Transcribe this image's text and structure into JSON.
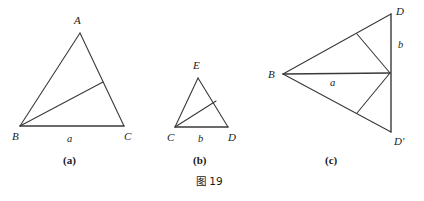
{
  "figure": {
    "caption": "图 19",
    "caption_x": 196,
    "caption_y": 176,
    "stroke_color": "#3a3a3a",
    "background_color": "#ffffff"
  },
  "panels": [
    {
      "id": "panel-a",
      "sublabel": "(a)",
      "sublabel_x": 63,
      "sublabel_y": 155,
      "description": "Triangle ABC with a cevian drawn from vertex B to a point on side AC",
      "vertices": [
        {
          "name": "A",
          "x": 80,
          "y": 33,
          "label_x": 74,
          "label_y": 15
        },
        {
          "name": "B",
          "x": 20,
          "y": 126,
          "label_x": 12,
          "label_y": 131
        },
        {
          "name": "C",
          "x": 124,
          "y": 126,
          "label_x": 124,
          "label_y": 131
        }
      ],
      "cevian_point": {
        "x": 103,
        "y": 82
      },
      "edge_labels": [
        {
          "text": "a",
          "x": 67,
          "y": 134,
          "side": "BC"
        }
      ]
    },
    {
      "id": "panel-b",
      "sublabel": "(b)",
      "sublabel_x": 193,
      "sublabel_y": 155,
      "description": "Triangle ECD with a cevian drawn from vertex C to a point on side ED",
      "vertices": [
        {
          "name": "E",
          "x": 198,
          "y": 78,
          "label_x": 193,
          "label_y": 60
        },
        {
          "name": "C",
          "x": 175,
          "y": 127,
          "label_x": 167,
          "label_y": 132
        },
        {
          "name": "D",
          "x": 228,
          "y": 127,
          "label_x": 228,
          "label_y": 132
        }
      ],
      "cevian_point": {
        "x": 216,
        "y": 101
      },
      "edge_labels": [
        {
          "text": "b",
          "x": 198,
          "y": 134,
          "side": "CD"
        }
      ]
    },
    {
      "id": "panel-c",
      "sublabel": "(c)",
      "sublabel_x": 325,
      "sublabel_y": 155,
      "description": "Kite B D D' with vertical segment D D', a horizontal segment from B to the midpoint of D D', and two interior segments from that midpoint to points on B D and B D'",
      "vertices": [
        {
          "name": "B",
          "x": 283,
          "y": 74,
          "label_x": 268,
          "label_y": 70
        },
        {
          "name": "D",
          "x": 391,
          "y": 14,
          "label_x": 396,
          "label_y": 6
        },
        {
          "name": "D'",
          "x": 391,
          "y": 132,
          "label_x": 394,
          "label_y": 136
        }
      ],
      "mid_point": {
        "x": 390,
        "y": 73
      },
      "cevian_point_upper": {
        "x": 357,
        "y": 34
      },
      "cevian_point_lower": {
        "x": 357,
        "y": 113
      },
      "edge_labels": [
        {
          "text": "a",
          "x": 330,
          "y": 79,
          "side": "B-to-midpoint"
        },
        {
          "text": "b",
          "x": 398,
          "y": 40,
          "side": "D-to-midpoint"
        }
      ]
    }
  ]
}
